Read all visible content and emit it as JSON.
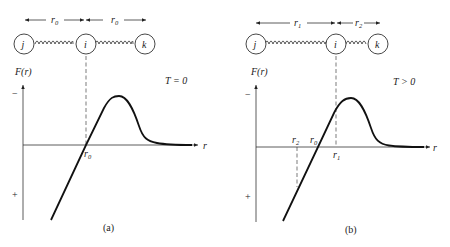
{
  "panels": [
    {
      "id": "a",
      "caption": "(a)",
      "condition": "T = 0",
      "atoms": [
        "j",
        "i",
        "k"
      ],
      "spacing_labels": [
        "r0",
        "r0"
      ],
      "y_axis_label": "F(r)",
      "x_axis_label": "r",
      "y_sign_top": "−",
      "y_sign_bottom": "+",
      "marks": [
        "r0"
      ]
    },
    {
      "id": "b",
      "caption": "(b)",
      "condition": "T > 0",
      "atoms": [
        "j",
        "i",
        "k"
      ],
      "spacing_labels": [
        "r1",
        "r2"
      ],
      "y_axis_label": "F(r)",
      "x_axis_label": "r",
      "y_sign_top": "−",
      "y_sign_bottom": "+",
      "marks": [
        "r2",
        "r0",
        "r1"
      ]
    }
  ],
  "text": {
    "a_jlabel": "j",
    "a_ilabel": "i",
    "a_klabel": "k",
    "a_r0_left": "r",
    "a_r0_right": "r",
    "a_sub0": "0",
    "a_F": "F(r)",
    "a_T": "T = 0",
    "a_minus": "−",
    "a_plus": "+",
    "a_r": "r",
    "a_cap": "(a)",
    "b_jlabel": "j",
    "b_ilabel": "i",
    "b_klabel": "k",
    "b_r": "r",
    "b_sub1": "1",
    "b_sub2": "2",
    "b_sub0": "0",
    "b_F": "F(r)",
    "b_T": "T > 0",
    "b_minus": "−",
    "b_plus": "+",
    "b_cap": "(b)"
  }
}
